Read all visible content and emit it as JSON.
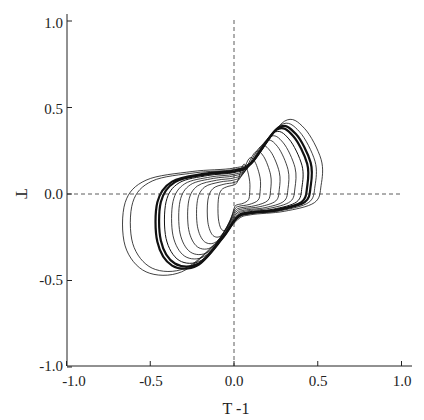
{
  "chart_data": {
    "type": "line",
    "title": "",
    "xlabel": "T -1",
    "ylabel": "T",
    "xlim": [
      -1.0,
      1.0
    ],
    "ylim": [
      -1.0,
      1.0
    ],
    "x_ticks": [
      "-1.0",
      "-0.5",
      "0.0",
      "0.5",
      "1.0"
    ],
    "y_ticks": [
      "1.0",
      "0.5",
      "0.0",
      "-0.5",
      "-1.0"
    ],
    "grid": false,
    "reference_lines": [
      {
        "orientation": "horizontal",
        "value": 0.0,
        "style": "dashed"
      },
      {
        "orientation": "vertical",
        "value": 0.0,
        "style": "dashed"
      }
    ],
    "series": [
      {
        "name": "trajectory",
        "loops": [
          {
            "scale": 0.18,
            "width": 0.8
          },
          {
            "scale": 0.3,
            "width": 0.8
          },
          {
            "scale": 0.42,
            "width": 0.8
          },
          {
            "scale": 0.52,
            "width": 0.8
          },
          {
            "scale": 0.62,
            "width": 0.8
          },
          {
            "scale": 0.7,
            "width": 0.8
          },
          {
            "scale": 0.78,
            "width": 1.0
          },
          {
            "scale": 0.84,
            "width": 2.2
          },
          {
            "scale": 0.88,
            "width": 2.2
          },
          {
            "scale": 0.93,
            "width": 0.8
          },
          {
            "scale": 1.0,
            "width": 0.8
          }
        ]
      }
    ],
    "limit_cycle_extent": {
      "x_min": -0.52,
      "x_max": 0.52,
      "y_min": -0.45,
      "y_max": 0.42
    }
  }
}
